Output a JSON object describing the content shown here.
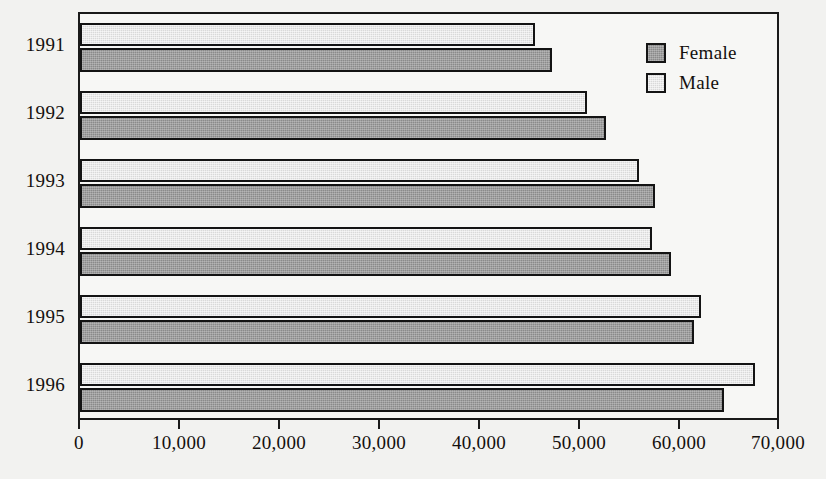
{
  "chart_data": {
    "type": "bar",
    "orientation": "horizontal",
    "title": "",
    "xlabel": "",
    "ylabel": "",
    "categories": [
      "1991",
      "1992",
      "1993",
      "1994",
      "1995",
      "1996"
    ],
    "series": [
      {
        "name": "Female",
        "color": "#8a8a8a",
        "values": [
          47400,
          52800,
          57700,
          59400,
          61700,
          64700
        ]
      },
      {
        "name": "Male",
        "color": "#d9d9d9",
        "values": [
          45700,
          50900,
          56100,
          57400,
          62400,
          67800
        ]
      }
    ],
    "xlim": [
      0,
      70000
    ],
    "xticks": [
      0,
      10000,
      20000,
      30000,
      40000,
      50000,
      60000,
      70000
    ],
    "xtick_labels": [
      "0",
      "10,000",
      "20,000",
      "30,000",
      "40,000",
      "50,000",
      "60,000",
      "70,000"
    ],
    "grid": false,
    "legend_position": "top-right",
    "legend_entries": [
      "Female",
      "Male"
    ],
    "frame": true
  },
  "colors": {
    "background": "#f2f2f0",
    "plot_background": "#f7f7f5",
    "axis": "#1a1a1a",
    "text": "#14100e",
    "female": "#8a8a8a",
    "male": "#d9d9d9"
  }
}
